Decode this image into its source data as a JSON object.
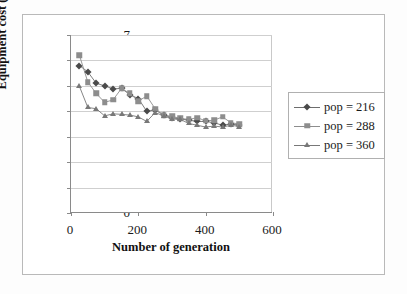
{
  "figure": {
    "background": "#ffffff",
    "frame_color": "#b9b9b9"
  },
  "chart_data": {
    "type": "scatter",
    "title": "",
    "xlabel": "Number of generation",
    "ylabel": "Equipment cost (€/cu.m)",
    "xlim": [
      0,
      600
    ],
    "ylim": [
      0,
      7
    ],
    "xticks": [
      0,
      200,
      400,
      600
    ],
    "yticks": [
      0,
      1,
      2,
      3,
      4,
      5,
      6,
      7
    ],
    "xtick_labels": [
      "0",
      "200",
      "400",
      "600"
    ],
    "ytick_labels": [
      "0",
      "1",
      "2",
      "3",
      "4",
      "5",
      "6",
      "7"
    ],
    "grid": "horizontal",
    "legend_position": "right",
    "series": [
      {
        "name": "pop = 216",
        "marker": "diamond",
        "color": "#4a4a4a",
        "line_color": "#6d6d6d",
        "x": [
          25,
          50,
          75,
          100,
          125,
          150,
          175,
          200,
          225,
          250,
          275,
          300,
          325,
          350,
          375,
          400,
          425,
          450,
          475,
          500
        ],
        "y": [
          5.8,
          5.55,
          5.1,
          5.0,
          4.88,
          4.9,
          4.65,
          4.5,
          4.0,
          4.05,
          3.85,
          3.75,
          3.7,
          3.65,
          3.6,
          3.6,
          3.55,
          3.45,
          3.5,
          3.45
        ]
      },
      {
        "name": "pop = 288",
        "marker": "square",
        "color": "#8d8d8d",
        "line_color": "#8d8d8d",
        "x": [
          25,
          50,
          75,
          100,
          125,
          150,
          175,
          200,
          225,
          250,
          275,
          300,
          325,
          350,
          375,
          400,
          425,
          450,
          475,
          500
        ],
        "y": [
          6.2,
          5.15,
          4.7,
          4.35,
          4.45,
          4.9,
          4.7,
          4.4,
          4.6,
          4.1,
          3.85,
          3.8,
          3.72,
          3.68,
          3.75,
          3.62,
          3.65,
          3.78,
          3.55,
          3.5
        ]
      },
      {
        "name": "pop = 360",
        "marker": "triangle",
        "color": "#787878",
        "line_color": "#787878",
        "x": [
          25,
          50,
          75,
          100,
          125,
          150,
          175,
          200,
          225,
          250,
          275,
          300,
          325,
          350,
          375,
          400,
          425,
          450,
          475,
          500
        ],
        "y": [
          4.98,
          4.15,
          4.1,
          3.82,
          3.9,
          3.88,
          3.85,
          3.78,
          3.6,
          3.95,
          3.82,
          3.7,
          3.68,
          3.52,
          3.45,
          3.38,
          3.42,
          3.38,
          3.45,
          3.4
        ]
      }
    ]
  },
  "legend": {
    "entries": [
      {
        "label": "pop = 216"
      },
      {
        "label": "pop = 288"
      },
      {
        "label": "pop = 360"
      }
    ]
  }
}
